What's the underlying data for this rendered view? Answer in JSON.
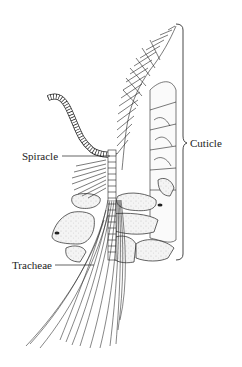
{
  "figure": {
    "labels": {
      "cuticle": "Cuticle",
      "spiracle": "Spiracle",
      "tracheae": "Tracheae"
    },
    "colors": {
      "line": "#222222",
      "cell_fill": "#f2f2f2",
      "stipple": "#9a9a9a",
      "background": "#ffffff"
    }
  }
}
